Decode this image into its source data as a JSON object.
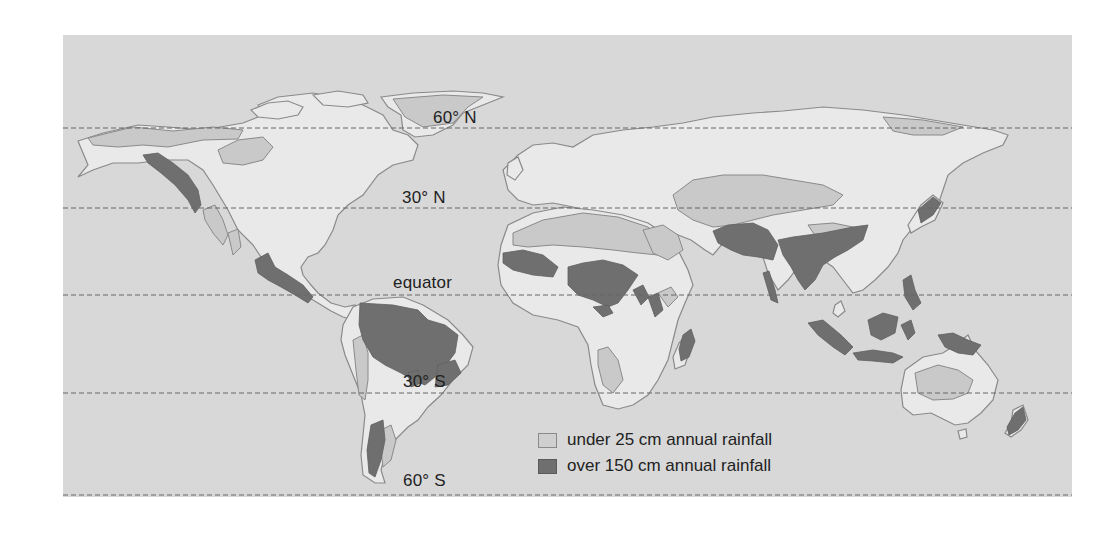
{
  "map": {
    "type": "world-rainfall-map",
    "colors": {
      "ocean": "#d8d8d8",
      "land": "#e9e9e9",
      "coastline": "#8a8a8a",
      "dry_region": "#c9c9c9",
      "wet_region": "#6f6f6f",
      "latitude_line": "#666666"
    },
    "latitude_lines": [
      {
        "label": "60° N",
        "y": 128
      },
      {
        "label": "30° N",
        "y": 208
      },
      {
        "label": "equator",
        "y": 295
      },
      {
        "label": "30° S",
        "y": 393
      },
      {
        "label": "60° S",
        "y": 495
      }
    ],
    "labels": {
      "lat_60n": "60° N",
      "lat_30n": "30° N",
      "equator": "equator",
      "lat_30s": "30° S",
      "lat_60s": "60° S"
    },
    "legend": {
      "items": [
        {
          "key": "dry",
          "label": "under 25 cm annual rainfall",
          "color": "#cfcfcf"
        },
        {
          "key": "wet",
          "label": "over 150 cm annual rainfall",
          "color": "#6f6f6f"
        }
      ]
    },
    "regions": {
      "dry": [
        "Alaska/N. Canada arctic",
        "Hudson Bay region",
        "Greenland",
        "SW United States",
        "Baja California",
        "Sahara & Arabia",
        "Central Asia",
        "Tibet/Gobi",
        "Siberian arctic",
        "Kalahari/Namib",
        "Horn of Africa",
        "Atacama/Peru coast",
        "Patagonia",
        "Central Australia"
      ],
      "wet": [
        "Pacific Northwest coast",
        "Central America",
        "Amazon basin",
        "SE Brazil",
        "Southern Chile",
        "West Africa coast",
        "Congo basin",
        "Madagascar east",
        "Western Ghats",
        "South & SE Asia monsoon",
        "Southern Japan",
        "Indonesia & Philippines",
        "New Guinea",
        "New Zealand"
      ]
    }
  }
}
